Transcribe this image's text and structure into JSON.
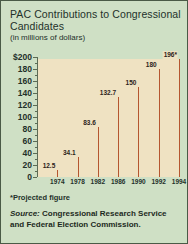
{
  "title": "PAC Contributions to Congressional Candidates",
  "subtitle": "(in millions of dollars)",
  "note": "*Projected figure",
  "source": {
    "label": "Source:",
    "text": " Congressional Research Service and Federal Election Commission."
  },
  "colors": {
    "background": "#cfe0c5",
    "border": "#4a5a46",
    "bar_fill": "#efe2c2",
    "bar_edge": "#b5562f",
    "axis": "#5c6b55",
    "text": "#23312a"
  },
  "chart_data": {
    "type": "bar",
    "title": "PAC Contributions to Congressional Candidates",
    "subtitle": "(in millions of dollars)",
    "xlabel": "",
    "ylabel": "millions of dollars",
    "ylim": [
      0,
      200
    ],
    "yticks": [
      0,
      20,
      40,
      60,
      80,
      100,
      120,
      140,
      160,
      180,
      200
    ],
    "ytick_labels": [
      "0",
      "20",
      "40",
      "60",
      "80",
      "100",
      "120",
      "140",
      "160",
      "180",
      "$200"
    ],
    "grid": false,
    "legend": null,
    "categories": [
      "1974",
      "1978",
      "1982",
      "1986",
      "1990",
      "1992",
      "1994"
    ],
    "values": [
      12.5,
      34.1,
      83.6,
      132.7,
      150,
      180,
      196
    ],
    "value_labels": [
      "12.5",
      "34.1",
      "83.6",
      "132.7",
      "150",
      "180",
      "196*"
    ],
    "annotations": [
      "*Projected figure"
    ],
    "source": "Source: Congressional Research Service and Federal Election Commission."
  }
}
